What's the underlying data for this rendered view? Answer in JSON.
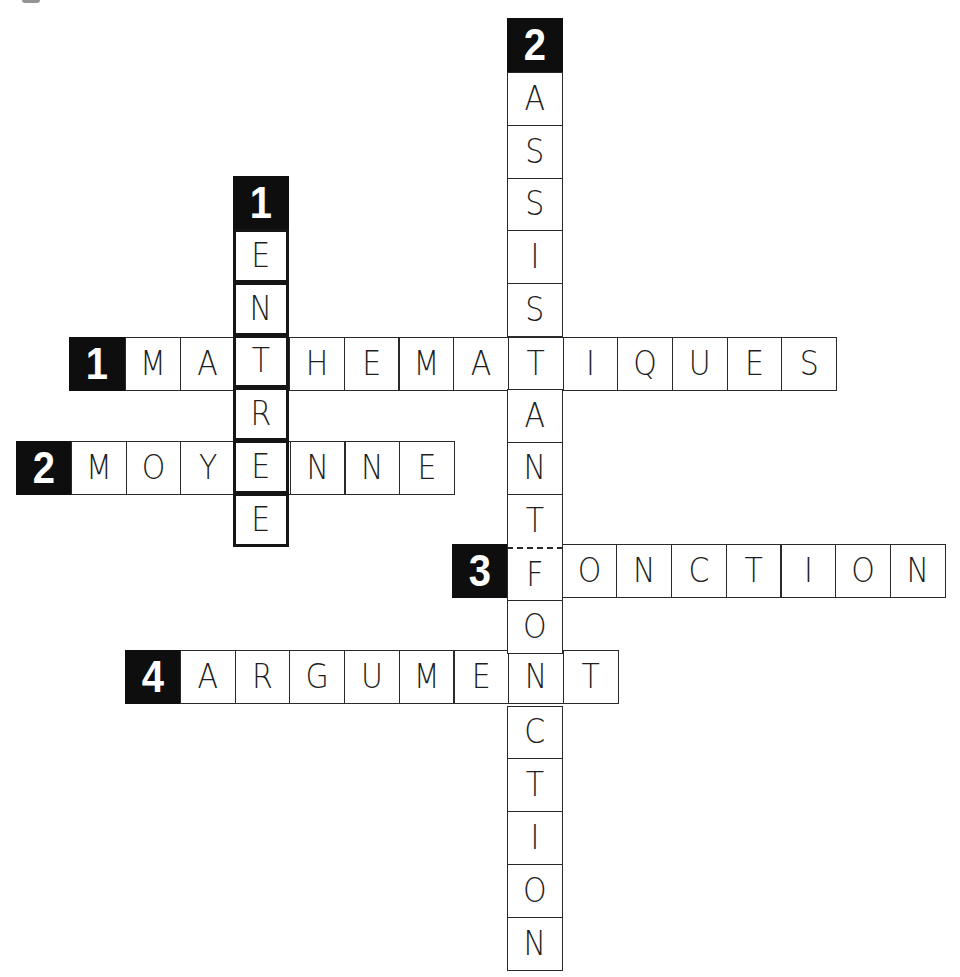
{
  "puzzle": {
    "type": "crossword",
    "cell_width": 54.7,
    "cell_height": 52.8,
    "colors": {
      "clue_background": "#0e0e0e",
      "clue_text": "#ffffff",
      "cell_border": "#2a2a2a",
      "letter": "#1e1e1e",
      "background": "#ffffff"
    }
  },
  "words": [
    {
      "id": "h1",
      "number": "1",
      "direction": "horizontal",
      "answer": "MATHEMATIQUES",
      "letters": [
        "M",
        "A",
        "T",
        "H",
        "E",
        "M",
        "A",
        "T",
        "I",
        "Q",
        "U",
        "E",
        "S"
      ],
      "clue_box": {
        "x": 69,
        "y": 337
      },
      "start": {
        "x": 125,
        "y": 337
      },
      "thick": false
    },
    {
      "id": "h2",
      "number": "2",
      "direction": "horizontal",
      "answer": "MOYENNE",
      "letters": [
        "M",
        "O",
        "Y",
        "E",
        "N",
        "N",
        "E"
      ],
      "clue_box": {
        "x": 16,
        "y": 441
      },
      "start": {
        "x": 71,
        "y": 441
      },
      "thick": false
    },
    {
      "id": "h3",
      "number": "3",
      "direction": "horizontal",
      "answer": "FONCTION",
      "letters": [
        "F",
        "O",
        "N",
        "C",
        "T",
        "I",
        "O",
        "N"
      ],
      "clue_box": {
        "x": 452,
        "y": 544
      },
      "start": {
        "x": 507,
        "y": 544
      },
      "thick": false
    },
    {
      "id": "h4",
      "number": "4",
      "direction": "horizontal",
      "answer": "ARGUMENT",
      "letters": [
        "A",
        "R",
        "G",
        "U",
        "M",
        "E",
        "N",
        "T"
      ],
      "clue_box": {
        "x": 125,
        "y": 650
      },
      "start": {
        "x": 180,
        "y": 650
      },
      "thick": false
    },
    {
      "id": "v1",
      "number": "1",
      "direction": "vertical",
      "answer": "ENTREE",
      "letters": [
        "E",
        "N",
        "T",
        "R",
        "E",
        "E"
      ],
      "clue_box": {
        "x": 233,
        "y": 176
      },
      "start": {
        "x": 233,
        "y": 229
      },
      "thick": true
    },
    {
      "id": "v2",
      "number": "2",
      "direction": "vertical",
      "answer": "ASSISTANT FONCTION",
      "letters": [
        "A",
        "S",
        "S",
        "I",
        "S",
        "T",
        "A",
        "N",
        "T",
        "F",
        "O",
        "N",
        "C",
        "T",
        "I",
        "O",
        "N"
      ],
      "word_break_before_index": 9,
      "clue_box": {
        "x": 507,
        "y": 18
      },
      "start": {
        "x": 507,
        "y": 72
      },
      "thick": false
    }
  ]
}
